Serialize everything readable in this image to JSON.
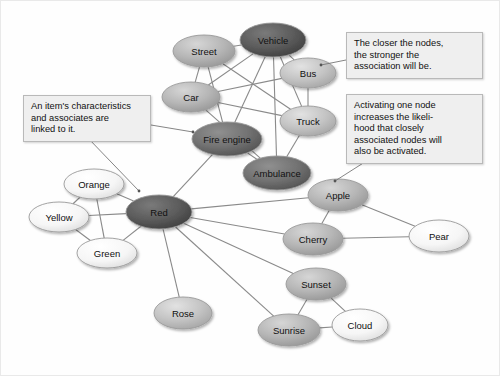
{
  "diagram": {
    "background": "#fefefe",
    "edge_color": "#8a8a8a",
    "callout_bg": "#efefef",
    "callout_border": "#b9b9b9"
  },
  "nodes": [
    {
      "id": "street",
      "label": "Street",
      "cx": 203,
      "cy": 50,
      "rx": 31,
      "ry": 16,
      "shade": "mid",
      "fill": "#b6b6b6",
      "text": "dark"
    },
    {
      "id": "vehicle",
      "label": "Vehicle",
      "cx": 272,
      "cy": 39,
      "rx": 33,
      "ry": 17,
      "shade": "very-dark",
      "fill": "#585858",
      "text": "light"
    },
    {
      "id": "bus",
      "label": "Bus",
      "cx": 307,
      "cy": 72,
      "rx": 28,
      "ry": 15,
      "shade": "mid-light",
      "fill": "#bdbdbd",
      "text": "dark"
    },
    {
      "id": "car",
      "label": "Car",
      "cx": 190,
      "cy": 96,
      "rx": 29,
      "ry": 15,
      "shade": "mid",
      "fill": "#bcbcbc",
      "text": "dark"
    },
    {
      "id": "truck",
      "label": "Truck",
      "cx": 307,
      "cy": 120,
      "rx": 28,
      "ry": 15,
      "shade": "mid-light",
      "fill": "#c2c2c2",
      "text": "dark"
    },
    {
      "id": "fireengine",
      "label": "Fire engine",
      "cx": 226,
      "cy": 138,
      "rx": 35,
      "ry": 17,
      "shade": "dark",
      "fill": "#6e6e6e",
      "text": "light"
    },
    {
      "id": "ambulance",
      "label": "Ambulance",
      "cx": 276,
      "cy": 172,
      "rx": 34,
      "ry": 17,
      "shade": "dark",
      "fill": "#606060",
      "text": "light"
    },
    {
      "id": "orange",
      "label": "Orange",
      "cx": 93,
      "cy": 183,
      "rx": 30,
      "ry": 15,
      "shade": "lightest",
      "fill": "#f4f4f4",
      "text": "dark"
    },
    {
      "id": "yellow",
      "label": "Yellow",
      "cx": 58,
      "cy": 216,
      "rx": 30,
      "ry": 15,
      "shade": "lightest",
      "fill": "#f6f6f6",
      "text": "dark"
    },
    {
      "id": "green",
      "label": "Green",
      "cx": 106,
      "cy": 252,
      "rx": 30,
      "ry": 15,
      "shade": "lightest",
      "fill": "#f4f4f4",
      "text": "dark"
    },
    {
      "id": "red",
      "label": "Red",
      "cx": 158,
      "cy": 211,
      "rx": 33,
      "ry": 17,
      "shade": "very-dark",
      "fill": "#5a5a5a",
      "text": "light"
    },
    {
      "id": "rose",
      "label": "Rose",
      "cx": 182,
      "cy": 312,
      "rx": 29,
      "ry": 16,
      "shade": "mid-light",
      "fill": "#c4c4c4",
      "text": "dark"
    },
    {
      "id": "apple",
      "label": "Apple",
      "cx": 337,
      "cy": 194,
      "rx": 30,
      "ry": 16,
      "shade": "mid",
      "fill": "#b2b2b2",
      "text": "dark"
    },
    {
      "id": "cherry",
      "label": "Cherry",
      "cx": 312,
      "cy": 238,
      "rx": 30,
      "ry": 16,
      "shade": "mid",
      "fill": "#b4b4b4",
      "text": "dark"
    },
    {
      "id": "pear",
      "label": "Pear",
      "cx": 438,
      "cy": 235,
      "rx": 30,
      "ry": 16,
      "shade": "lightest",
      "fill": "#f5f5f5",
      "text": "dark"
    },
    {
      "id": "sunset",
      "label": "Sunset",
      "cx": 315,
      "cy": 283,
      "rx": 30,
      "ry": 16,
      "shade": "mid",
      "fill": "#b0b0b0",
      "text": "dark"
    },
    {
      "id": "sunrise",
      "label": "Sunrise",
      "cx": 288,
      "cy": 329,
      "rx": 31,
      "ry": 16,
      "shade": "mid",
      "fill": "#b0b0b0",
      "text": "dark"
    },
    {
      "id": "cloud",
      "label": "Cloud",
      "cx": 359,
      "cy": 324,
      "rx": 28,
      "ry": 16,
      "shade": "lightest",
      "fill": "#f7f7f7",
      "text": "dark"
    }
  ],
  "edges": [
    [
      "street",
      "vehicle"
    ],
    [
      "street",
      "car"
    ],
    [
      "street",
      "fireengine"
    ],
    [
      "street",
      "truck"
    ],
    [
      "vehicle",
      "car"
    ],
    [
      "vehicle",
      "bus"
    ],
    [
      "vehicle",
      "truck"
    ],
    [
      "vehicle",
      "fireengine"
    ],
    [
      "vehicle",
      "ambulance"
    ],
    [
      "bus",
      "truck"
    ],
    [
      "bus",
      "car"
    ],
    [
      "car",
      "truck"
    ],
    [
      "car",
      "ambulance"
    ],
    [
      "truck",
      "ambulance"
    ],
    [
      "fireengine",
      "ambulance"
    ],
    [
      "fireengine",
      "red"
    ],
    [
      "red",
      "orange"
    ],
    [
      "red",
      "yellow"
    ],
    [
      "red",
      "green"
    ],
    [
      "red",
      "rose"
    ],
    [
      "red",
      "apple"
    ],
    [
      "red",
      "cherry"
    ],
    [
      "red",
      "sunset"
    ],
    [
      "red",
      "sunrise"
    ],
    [
      "orange",
      "yellow"
    ],
    [
      "orange",
      "green"
    ],
    [
      "yellow",
      "green"
    ],
    [
      "apple",
      "cherry"
    ],
    [
      "apple",
      "pear"
    ],
    [
      "cherry",
      "pear"
    ],
    [
      "sunset",
      "sunrise"
    ],
    [
      "sunset",
      "cloud"
    ],
    [
      "sunrise",
      "cloud"
    ]
  ],
  "callouts": [
    {
      "id": "characteristics",
      "text": "An item's characteristics\nand associates are\nlinked to it.",
      "x": 22,
      "y": 94,
      "w": 128,
      "h": 42,
      "leaders": [
        {
          "from_x": 150,
          "from_y": 124,
          "to_x": 192,
          "to_y": 131
        },
        {
          "from_x": 86,
          "from_y": 136,
          "to_x": 138,
          "to_y": 190
        }
      ]
    },
    {
      "id": "closer-nodes",
      "text": "The closer the nodes,\nthe stronger the\nassociation will be.",
      "x": 345,
      "y": 31,
      "w": 137,
      "h": 42,
      "leaders": [
        {
          "from_x": 345,
          "from_y": 59,
          "to_x": 320,
          "to_y": 64
        }
      ]
    },
    {
      "id": "activating-node",
      "text": "Activating one node\nincreases the likeli-\nhood that closely\nassociated nodes will\nalso be activated.",
      "x": 345,
      "y": 93,
      "w": 137,
      "h": 66,
      "leaders": [
        {
          "from_x": 367,
          "from_y": 159,
          "to_x": 334,
          "to_y": 180
        }
      ]
    }
  ]
}
